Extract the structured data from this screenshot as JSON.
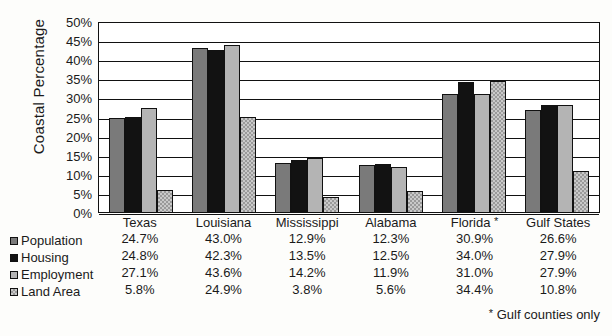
{
  "chart_data": {
    "type": "bar",
    "title": "",
    "xlabel": "",
    "ylabel": "Coastal Percentage",
    "ylim": [
      0,
      50
    ],
    "ytick_step": 5,
    "ytick_labels": [
      "50%",
      "45%",
      "40%",
      "35%",
      "30%",
      "25%",
      "20%",
      "15%",
      "10%",
      "5%",
      "0%"
    ],
    "grid": true,
    "legend_position": "bottom-left",
    "categories": [
      "Texas",
      "Louisiana",
      "Mississippi",
      "Alabama",
      "Florida *",
      "Gulf States"
    ],
    "series": [
      {
        "name": "Population",
        "values": [
          24.7,
          43.0,
          12.9,
          12.3,
          30.9,
          26.6
        ],
        "color": "#7a7a7a"
      },
      {
        "name": "Housing",
        "values": [
          24.8,
          42.3,
          13.5,
          12.5,
          34.0,
          27.9
        ],
        "color": "#121212"
      },
      {
        "name": "Employment",
        "values": [
          27.1,
          43.6,
          14.2,
          11.9,
          31.0,
          27.9
        ],
        "color": "#b4b4b4"
      },
      {
        "name": "Land Area",
        "values": [
          5.8,
          24.9,
          3.8,
          5.6,
          34.4,
          10.8
        ],
        "color": "#c9c9c9"
      }
    ],
    "value_labels": [
      [
        "24.7%",
        "43.0%",
        "12.9%",
        "12.3%",
        "30.9%",
        "26.6%"
      ],
      [
        "24.8%",
        "42.3%",
        "13.5%",
        "12.5%",
        "34.0%",
        "27.9%"
      ],
      [
        "27.1%",
        "43.6%",
        "14.2%",
        "11.9%",
        "31.0%",
        "27.9%"
      ],
      [
        "5.8%",
        "24.9%",
        "3.8%",
        "5.6%",
        "34.4%",
        "10.8%"
      ]
    ],
    "annotations": [
      "* Gulf counties only"
    ]
  },
  "axis": {
    "y_title": "Coastal Percentage"
  },
  "footnote": {
    "star": "*",
    "text": "Gulf counties only"
  }
}
